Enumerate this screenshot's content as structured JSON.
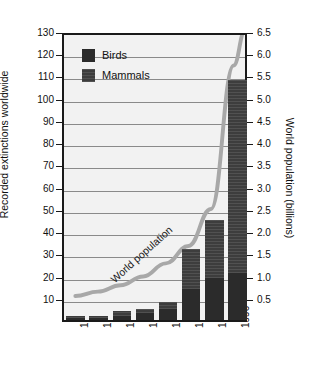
{
  "chart_data": {
    "type": "bar",
    "title": "",
    "subtitle": "",
    "xlabel": "",
    "ylabel": "Recorded extinctions worldwide",
    "y2label": "World population (billions)",
    "categories": [
      "1650",
      "1700",
      "1750",
      "1800",
      "1850",
      "1900",
      "1950",
      "1996"
    ],
    "ylim": [
      0,
      130
    ],
    "yticks": [
      10,
      20,
      30,
      40,
      50,
      60,
      70,
      80,
      90,
      100,
      110,
      120,
      130
    ],
    "y2lim": [
      0,
      6.5
    ],
    "y2ticks": [
      0.5,
      1.0,
      1.5,
      2.0,
      2.5,
      3.0,
      3.5,
      4.0,
      4.5,
      5.0,
      5.5,
      6.0,
      6.5
    ],
    "grid": true,
    "legend_position": "upper-left",
    "series": [
      {
        "name": "Birds",
        "color": "#2b2b2b",
        "values": [
          1,
          1,
          2,
          3,
          5,
          14,
          19,
          21
        ]
      },
      {
        "name": "Mammals",
        "color": "#3d3d3d",
        "values": [
          1,
          1,
          2,
          2,
          3,
          18,
          26,
          87
        ]
      }
    ],
    "totals": [
      2,
      2,
      4,
      5,
      8,
      32,
      45,
      108
    ],
    "annotations": [
      {
        "name": "world-population-curve",
        "label": "World population",
        "color": "#a8a8a8",
        "axis": "right",
        "points": [
          {
            "x": "1650",
            "y": 0.5
          },
          {
            "x": "1700",
            "y": 0.6
          },
          {
            "x": "1750",
            "y": 0.75
          },
          {
            "x": "1800",
            "y": 0.95
          },
          {
            "x": "1850",
            "y": 1.25
          },
          {
            "x": "1900",
            "y": 1.65
          },
          {
            "x": "1950",
            "y": 2.5
          },
          {
            "x": "1996",
            "y": 5.8
          }
        ]
      }
    ]
  },
  "legend": {
    "items": [
      {
        "label": "Birds",
        "swatch": "birds-swatch"
      },
      {
        "label": "Mammals",
        "swatch": "mammals-swatch"
      }
    ]
  }
}
